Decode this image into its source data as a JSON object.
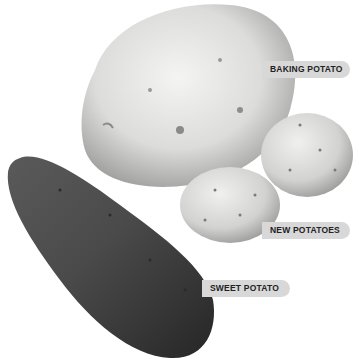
{
  "illustration": {
    "subject": "potato varieties",
    "labels": [
      {
        "id": "baking",
        "text": "BAKING POTATO"
      },
      {
        "id": "new",
        "text": "NEW POTATOES"
      },
      {
        "id": "sweet",
        "text": "SWEET POTATO"
      }
    ]
  }
}
